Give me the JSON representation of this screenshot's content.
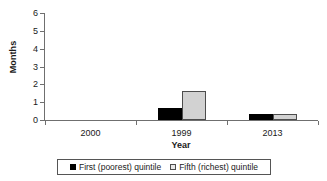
{
  "chart_data": {
    "type": "bar",
    "title": "",
    "xlabel": "Year",
    "ylabel": "Months",
    "categories": [
      "2000",
      "1999",
      "2013"
    ],
    "series": [
      {
        "name": "First (poorest) quintile",
        "color": "#000000",
        "values": [
          0,
          0.67,
          0.33
        ]
      },
      {
        "name": "Fifth (richest) quintile",
        "color": "#d2d2d2",
        "values": [
          0,
          1.65,
          0.33
        ]
      }
    ],
    "ylim": [
      0,
      6
    ],
    "ytick_labels": [
      "0",
      "1",
      "2",
      "3",
      "4",
      "5",
      "6"
    ],
    "grid": false,
    "legend_position": "bottom"
  },
  "legend": {
    "items": [
      {
        "label": "First (poorest) quintile",
        "swatch": "filled-black-square"
      },
      {
        "label": "Fifth (richest) quintile",
        "swatch": "outlined-light-square"
      }
    ]
  }
}
